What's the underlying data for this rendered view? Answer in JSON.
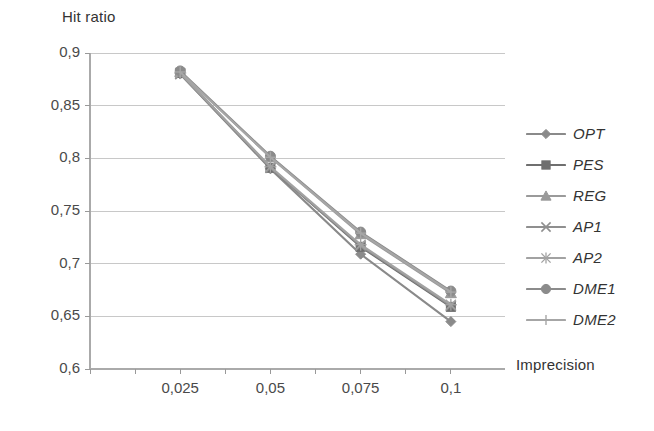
{
  "chart_data": {
    "type": "line",
    "title": "",
    "xlabel": "Imprecision",
    "ylabel": "Hit ratio",
    "x": [
      0.025,
      0.05,
      0.075,
      0.1
    ],
    "x_tick_labels": [
      "0,025",
      "0,05",
      "0,075",
      "0,1"
    ],
    "y_tick_labels": [
      "0,9",
      "0,85",
      "0,8",
      "0,75",
      "0,7",
      "0,65",
      "0,6"
    ],
    "y_ticks": [
      0.9,
      0.85,
      0.8,
      0.75,
      0.7,
      0.65,
      0.6
    ],
    "xlim": [
      0.0,
      0.115
    ],
    "ylim": [
      0.6,
      0.9
    ],
    "grid": "horizontal",
    "legend_position": "right",
    "series": [
      {
        "name": "OPT",
        "marker": "diamond",
        "color": "#8a8a8a",
        "values": [
          0.88,
          0.79,
          0.709,
          0.645
        ]
      },
      {
        "name": "PES",
        "marker": "square",
        "color": "#6f6f6f",
        "values": [
          0.881,
          0.791,
          0.716,
          0.659
        ]
      },
      {
        "name": "REG",
        "marker": "triangle",
        "color": "#9a9a9a",
        "values": [
          0.882,
          0.801,
          0.728,
          0.672
        ]
      },
      {
        "name": "AP1",
        "marker": "cross",
        "color": "#8f8f8f",
        "values": [
          0.88,
          0.791,
          0.717,
          0.66
        ]
      },
      {
        "name": "AP2",
        "marker": "star",
        "color": "#a2a2a2",
        "values": [
          0.881,
          0.792,
          0.718,
          0.661
        ]
      },
      {
        "name": "DME1",
        "marker": "circle",
        "color": "#8b8b8b",
        "values": [
          0.883,
          0.802,
          0.73,
          0.674
        ]
      },
      {
        "name": "DME2",
        "marker": "plus",
        "color": "#a6a6a6",
        "values": [
          0.882,
          0.801,
          0.729,
          0.673
        ]
      }
    ]
  }
}
